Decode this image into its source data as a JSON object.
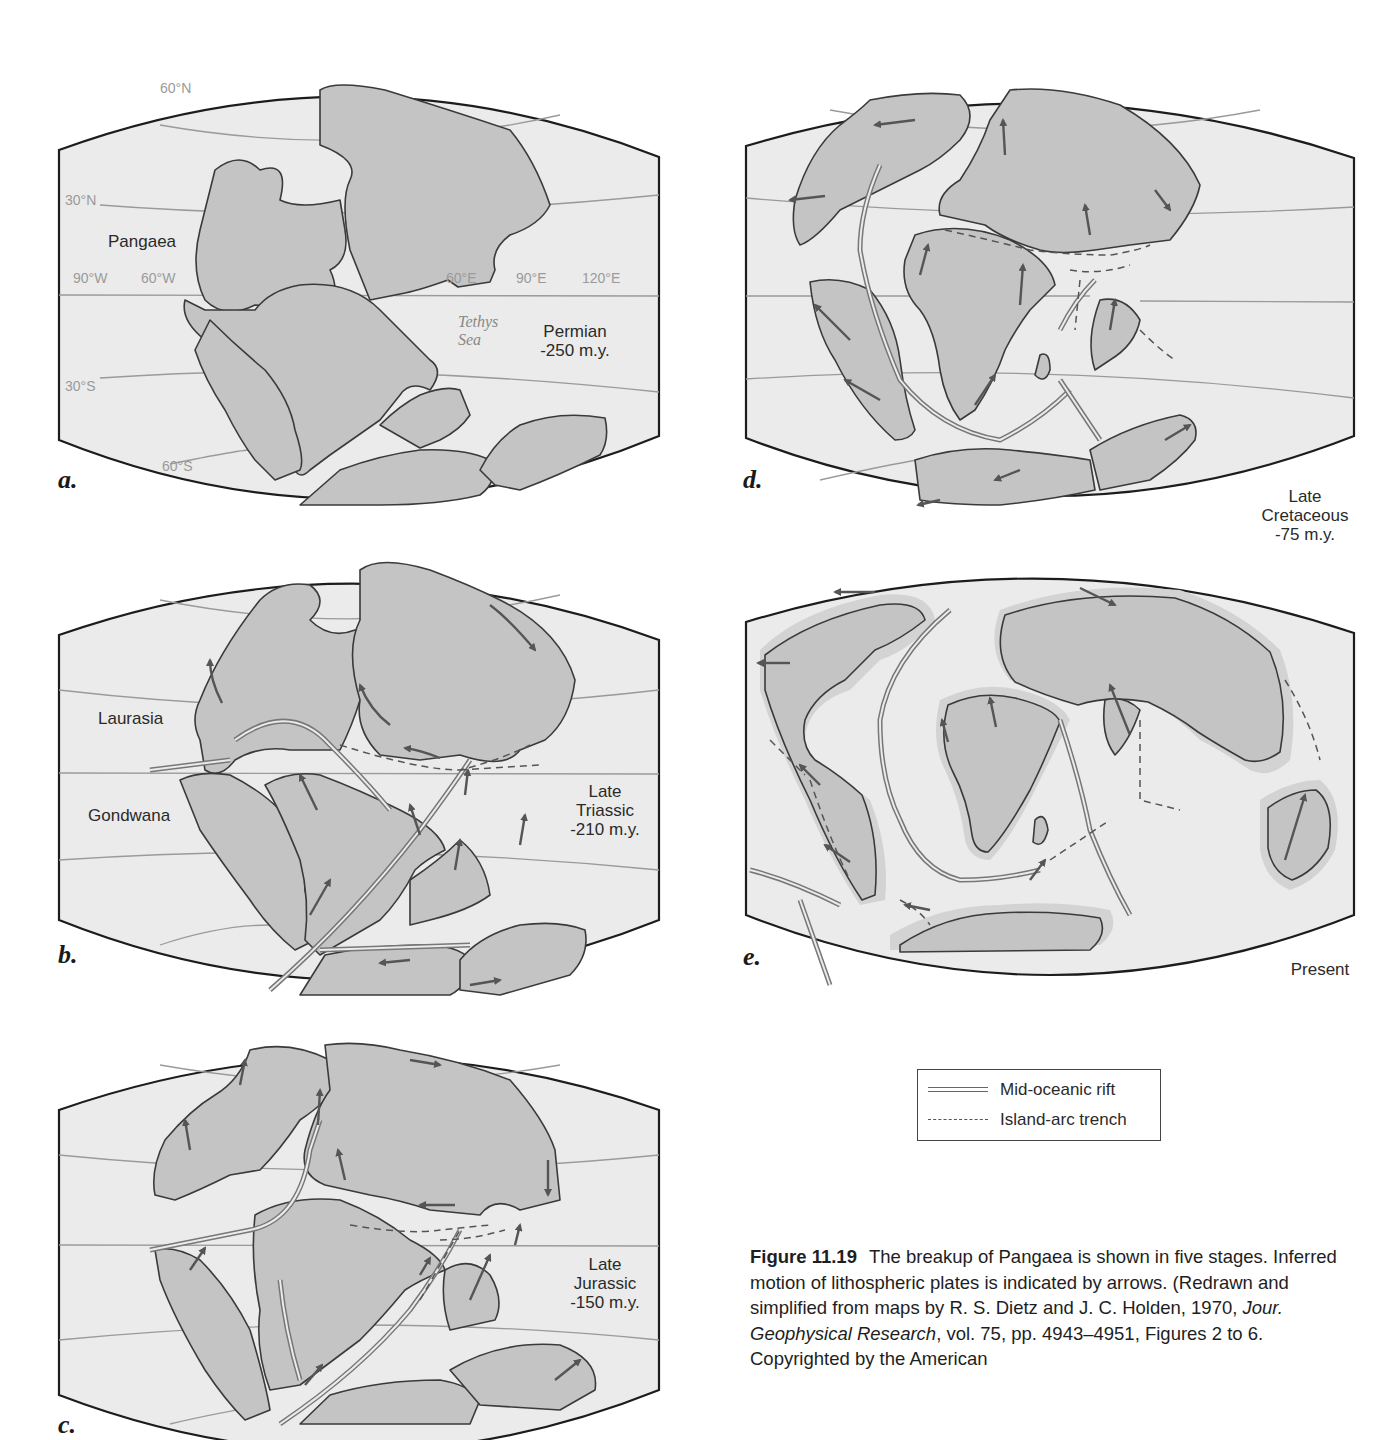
{
  "figure": {
    "number": "Figure 11.19",
    "caption_parts": {
      "p1": "The breakup of Pangaea is shown in five stages. Inferred motion of lithospheric plates is indicated by arrows. (Redrawn and simplified from maps by R. S. Dietz and J. C. Holden, 1970, ",
      "journal": "Jour. Geophysical Research",
      "p2": ", vol. 75, pp. 4943–4951, Figures 2 to 6. Copyrighted by the American"
    }
  },
  "panels": {
    "a": {
      "letter": "a.",
      "stage_line1": "Permian",
      "stage_line2": "-250 m.y.",
      "supercontinent": "Pangaea",
      "sea": "Tethys Sea",
      "latitudes": [
        "60°N",
        "30°N",
        "30°S",
        "60°S"
      ],
      "longitudes": [
        "90°W",
        "60°W",
        "60°E",
        "90°E",
        "120°E"
      ]
    },
    "b": {
      "letter": "b.",
      "stage_line1": "Late",
      "stage_line2": "Triassic",
      "stage_line3": "-210 m.y.",
      "north_continent": "Laurasia",
      "south_continent": "Gondwana"
    },
    "c": {
      "letter": "c.",
      "stage_line1": "Late",
      "stage_line2": "Jurassic",
      "stage_line3": "-150 m.y."
    },
    "d": {
      "letter": "d.",
      "stage_line1": "Late",
      "stage_line2": "Cretaceous",
      "stage_line3": "-75 m.y."
    },
    "e": {
      "letter": "e.",
      "stage_line1": "Present"
    }
  },
  "legend": {
    "items": [
      {
        "symbol": "double-line",
        "label": "Mid-oceanic rift"
      },
      {
        "symbol": "dashed-line",
        "label": "Island-arc trench"
      }
    ]
  },
  "colors": {
    "ocean": "#ebebeb",
    "land": "#c4c4c4",
    "outline": "#1c1c1c",
    "graticule": "#9a9a9a"
  }
}
